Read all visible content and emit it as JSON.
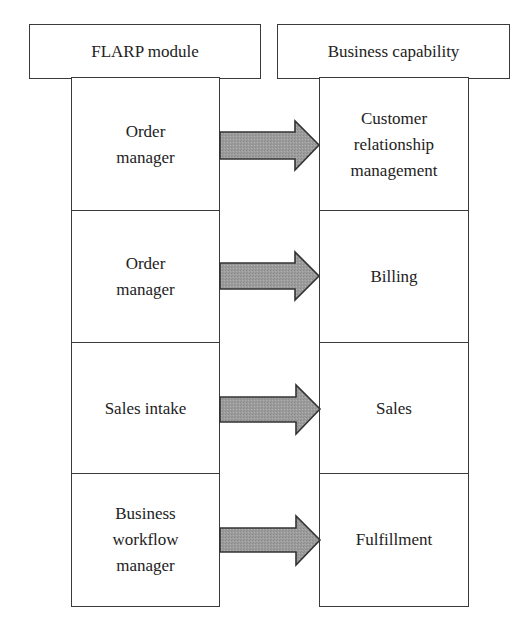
{
  "diagram": {
    "headers": {
      "left": "FLARP module",
      "right": "Business capability"
    },
    "rows": [
      {
        "module": "Order manager",
        "module_lines": [
          "Order",
          "manager"
        ],
        "capability": "Customer relationship management",
        "capability_lines": [
          "Customer",
          "relationship",
          "management"
        ]
      },
      {
        "module": "Order manager",
        "module_lines": [
          "Order",
          "manager"
        ],
        "capability": "Billing",
        "capability_lines": [
          "Billing"
        ]
      },
      {
        "module": "Sales intake",
        "module_lines": [
          "Sales intake"
        ],
        "capability": "Sales",
        "capability_lines": [
          "Sales"
        ]
      },
      {
        "module": "Business workflow manager",
        "module_lines": [
          "Business",
          "workflow",
          "manager"
        ],
        "capability": "Fulfillment",
        "capability_lines": [
          "Fulfillment"
        ]
      }
    ],
    "arrow_direction": "module-to-capability",
    "colors": {
      "border": "#3a3a3a",
      "arrow_fill": "#9c9c9c",
      "arrow_stroke": "#333333",
      "background": "#ffffff"
    }
  }
}
